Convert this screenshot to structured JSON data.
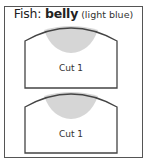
{
  "title": {
    "prefix": "Fish: ",
    "bold": "belly",
    "suffix": " (light blue)"
  },
  "cuts": [
    {
      "label": "Cut 1"
    },
    {
      "label": "Cut 1"
    }
  ],
  "colors": {
    "outline": "#444444",
    "fill": "#d6d6d6",
    "frame": "#555555"
  }
}
